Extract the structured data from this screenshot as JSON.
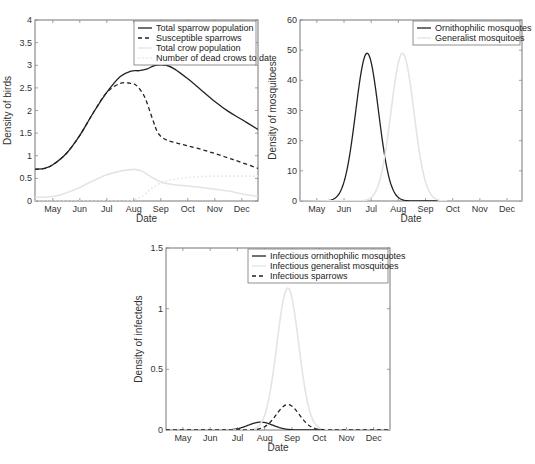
{
  "chart_data": [
    {
      "id": "birds",
      "type": "line",
      "title": "",
      "xlabel": "Date",
      "ylabel": "Density of birds",
      "x_ticks": [
        "May",
        "Jun",
        "Jul",
        "Aug",
        "Sep",
        "Oct",
        "Nov",
        "Dec"
      ],
      "y_ticks": [
        "0",
        "0.5",
        "1",
        "1.5",
        "2",
        "2.5",
        "3",
        "3.5",
        "4"
      ],
      "ylim": [
        0,
        4
      ],
      "xlim_months": [
        -0.66,
        7.6
      ],
      "legend_position": "upper right",
      "frame": {
        "left": 35,
        "top": 20,
        "right": 258,
        "bottom": 201
      },
      "series": [
        {
          "name": "Total sparrow population",
          "style": "solid",
          "color": "#222222",
          "x": [
            -0.66,
            -0.3,
            0,
            0.5,
            1,
            1.5,
            2,
            2.5,
            2.9,
            3.2,
            3.5,
            3.8,
            4.2,
            4.5,
            5,
            5.5,
            6,
            6.5,
            7,
            7.6
          ],
          "y": [
            0.7,
            0.72,
            0.8,
            1.05,
            1.45,
            1.95,
            2.4,
            2.75,
            2.87,
            2.88,
            2.92,
            3.0,
            3.0,
            2.92,
            2.7,
            2.45,
            2.2,
            1.98,
            1.8,
            1.58
          ]
        },
        {
          "name": "Susceptible sparrows",
          "style": "dashed",
          "color": "#222222",
          "x": [
            -0.66,
            -0.3,
            0,
            0.5,
            1,
            1.5,
            2,
            2.5,
            2.9,
            3.1,
            3.4,
            3.7,
            3.9,
            4.2,
            4.6,
            5,
            5.5,
            6,
            6.5,
            7,
            7.6
          ],
          "y": [
            0.7,
            0.72,
            0.8,
            1.05,
            1.45,
            1.95,
            2.4,
            2.6,
            2.6,
            2.55,
            2.3,
            1.8,
            1.5,
            1.35,
            1.28,
            1.22,
            1.14,
            1.05,
            0.95,
            0.85,
            0.72
          ]
        },
        {
          "name": "Total crow population",
          "style": "solid",
          "color": "#e4e4e4",
          "x": [
            -0.66,
            0,
            0.5,
            1,
            1.5,
            2,
            2.5,
            3,
            3.3,
            3.6,
            4,
            4.5,
            5,
            5.5,
            6,
            6.5,
            7,
            7.6
          ],
          "y": [
            0.08,
            0.1,
            0.18,
            0.3,
            0.45,
            0.58,
            0.66,
            0.7,
            0.66,
            0.55,
            0.42,
            0.36,
            0.33,
            0.3,
            0.26,
            0.22,
            0.16,
            0.1
          ]
        },
        {
          "name": "Number of dead crows to date",
          "style": "dotted",
          "color": "#e4e4e4",
          "x": [
            -0.66,
            2.5,
            3,
            3.3,
            3.6,
            4,
            4.5,
            5,
            5.5,
            6,
            7,
            7.6
          ],
          "y": [
            0,
            0,
            0.03,
            0.1,
            0.25,
            0.4,
            0.48,
            0.52,
            0.54,
            0.55,
            0.55,
            0.55
          ]
        }
      ]
    },
    {
      "id": "mosquitoes",
      "type": "line",
      "title": "",
      "xlabel": "Date",
      "ylabel": "Density of mosquitoes",
      "x_ticks": [
        "May",
        "Jun",
        "Jul",
        "Aug",
        "Sep",
        "Oct",
        "Nov",
        "Dec"
      ],
      "y_ticks": [
        "0",
        "10",
        "20",
        "30",
        "40",
        "50",
        "60"
      ],
      "ylim": [
        0,
        60
      ],
      "xlim_months": [
        -0.62,
        7.55
      ],
      "legend_position": "upper right",
      "frame": {
        "left": 300,
        "top": 20,
        "right": 522,
        "bottom": 201
      },
      "series": [
        {
          "name": "Ornithophilic mosquotes",
          "style": "solid",
          "color": "#222222",
          "gauss": {
            "mu": 1.85,
            "sigma": 0.42,
            "peak": 49,
            "from": 0.4,
            "to": 4.5
          }
        },
        {
          "name": "Generalist mosquitoes",
          "style": "solid",
          "color": "#e4e4e4",
          "gauss": {
            "mu": 3.15,
            "sigma": 0.42,
            "peak": 49,
            "from": 1.7,
            "to": 5.8
          }
        }
      ]
    },
    {
      "id": "infecteds",
      "type": "line",
      "title": "",
      "xlabel": "Date",
      "ylabel": "Density of infecteds",
      "x_ticks": [
        "May",
        "Jun",
        "Jul",
        "Aug",
        "Sep",
        "Oct",
        "Nov",
        "Dec"
      ],
      "y_ticks": [
        "0",
        "0.5",
        "1",
        "1.5"
      ],
      "ylim": [
        0,
        1.5
      ],
      "xlim_months": [
        -0.62,
        7.6
      ],
      "legend_position": "upper right",
      "frame": {
        "left": 166,
        "top": 248,
        "right": 390,
        "bottom": 430
      },
      "series": [
        {
          "name": "Infectious ornithophilic mosquotes",
          "style": "solid",
          "color": "#222222",
          "gauss": {
            "mu": 2.85,
            "sigma": 0.45,
            "peak": 0.065,
            "from": 1.3,
            "to": 5.0
          }
        },
        {
          "name": "Infectious generalist mosquitoes",
          "style": "solid",
          "color": "#e4e4e4",
          "gauss": {
            "mu": 3.85,
            "sigma": 0.4,
            "peak": 1.17,
            "from": 2.2,
            "to": 5.5
          }
        },
        {
          "name": "Infectious sparrows",
          "style": "dashed",
          "color": "#222222",
          "gauss": {
            "mu": 3.85,
            "sigma": 0.42,
            "peak": 0.21,
            "from": -0.62,
            "to": 7.6,
            "floor": 0
          }
        }
      ]
    }
  ]
}
